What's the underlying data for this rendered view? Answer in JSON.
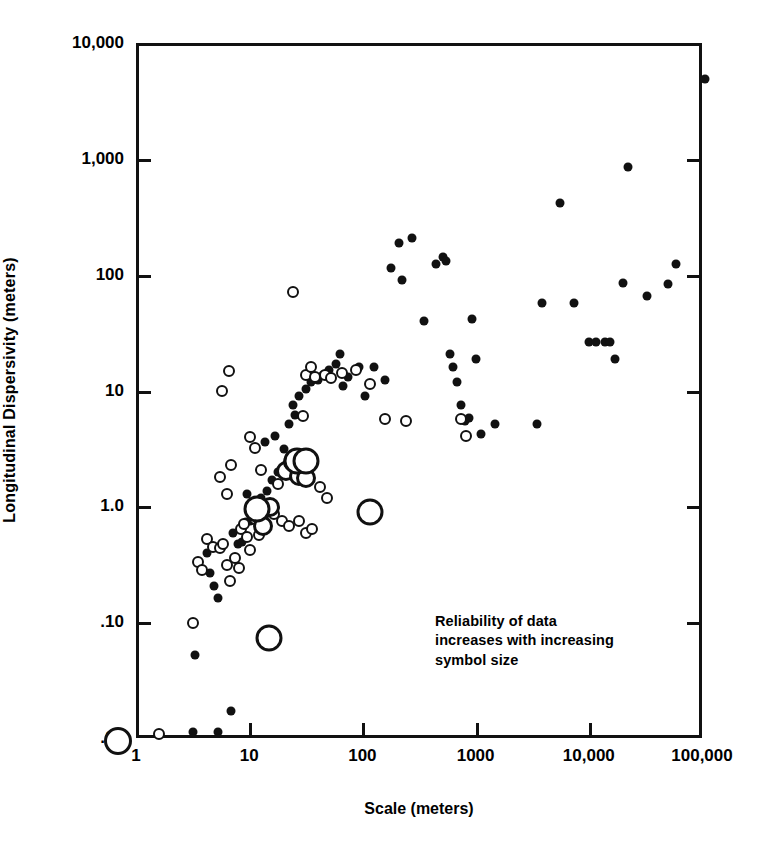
{
  "chart_data": {
    "type": "scatter",
    "title": "",
    "xlabel": "Scale (meters)",
    "ylabel": "Longitudinal Dispersivity (meters)",
    "xscale": "log",
    "yscale": "log",
    "xlim": [
      1,
      100000
    ],
    "ylim": [
      0.01,
      10000
    ],
    "xticks": [
      1,
      10,
      100,
      1000,
      10000,
      100000
    ],
    "xticklabels": [
      "1",
      "10",
      "100",
      "1000",
      "10,000",
      "100,000"
    ],
    "yticks": [
      0.01,
      0.1,
      1.0,
      10,
      100,
      1000,
      10000
    ],
    "yticklabels": [
      ".01",
      ".10",
      "1.0",
      "10",
      "100",
      "1,000",
      "10,000"
    ],
    "grid": false,
    "legend_position": "none",
    "annotation": "Reliability of data\nincreases with increasing\nsymbol size",
    "symbol_legend": {
      "description": "Symbol size encodes data reliability; larger symbol means more reliable data",
      "classes": [
        {
          "name": "low-reliability-filled",
          "style": "filled-dot",
          "px": 9
        },
        {
          "name": "moderate-reliability-open-small",
          "style": "open-circle",
          "px": 12
        },
        {
          "name": "high-reliability-open-medium",
          "style": "open-circle",
          "px": 20
        },
        {
          "name": "highest-reliability-open-large",
          "style": "open-circle",
          "px": 27
        }
      ]
    },
    "series": [
      {
        "name": "low-reliability-filled",
        "symbol": "filled-dot",
        "size_px": 9,
        "points": [
          [
            3.0,
            0.012
          ],
          [
            5.0,
            0.012
          ],
          [
            6.5,
            0.018
          ],
          [
            3.1,
            0.055
          ],
          [
            4.2,
            0.28
          ],
          [
            4.6,
            0.22
          ],
          [
            5.0,
            0.17
          ],
          [
            4.0,
            0.42
          ],
          [
            7.5,
            0.5
          ],
          [
            8.2,
            0.52
          ],
          [
            6.8,
            0.62
          ],
          [
            8.8,
            0.78
          ],
          [
            9.5,
            0.8
          ],
          [
            11.0,
            0.95
          ],
          [
            12.0,
            1.25
          ],
          [
            13.5,
            1.45
          ],
          [
            9.0,
            1.35
          ],
          [
            15.0,
            1.8
          ],
          [
            17.0,
            2.1
          ],
          [
            20.0,
            2.4
          ],
          [
            22.0,
            2.7
          ],
          [
            24.0,
            2.9
          ],
          [
            26.0,
            2.3
          ],
          [
            19.0,
            3.3
          ],
          [
            13.0,
            3.8
          ],
          [
            16.0,
            4.3
          ],
          [
            21.0,
            5.5
          ],
          [
            24.0,
            6.5
          ],
          [
            23.0,
            8.0
          ],
          [
            26.0,
            9.5
          ],
          [
            30.0,
            11.0
          ],
          [
            33.0,
            12.5
          ],
          [
            38.0,
            13.0
          ],
          [
            42.0,
            14.5
          ],
          [
            48.0,
            16.0
          ],
          [
            55.0,
            18.0
          ],
          [
            60.0,
            22.0
          ],
          [
            64.0,
            11.5
          ],
          [
            70.0,
            14.0
          ],
          [
            88.0,
            17.0
          ],
          [
            100.0,
            9.5
          ],
          [
            120.0,
            17.0
          ],
          [
            150.0,
            13.0
          ],
          [
            200.0,
            200.0
          ],
          [
            260.0,
            220.0
          ],
          [
            170.0,
            120.0
          ],
          [
            210.0,
            95.0
          ],
          [
            330.0,
            42.0
          ],
          [
            420.0,
            130.0
          ],
          [
            480.0,
            150.0
          ],
          [
            520.0,
            140.0
          ],
          [
            560.0,
            22.0
          ],
          [
            600.0,
            17.0
          ],
          [
            640.0,
            12.5
          ],
          [
            700.0,
            8.0
          ],
          [
            760.0,
            5.8
          ],
          [
            820.0,
            6.2
          ],
          [
            880.0,
            44.0
          ],
          [
            950.0,
            20.0
          ],
          [
            1050.0,
            4.5
          ],
          [
            1400.0,
            5.5
          ],
          [
            3300.0,
            5.5
          ],
          [
            3600.0,
            60.0
          ],
          [
            5200.0,
            440.0
          ],
          [
            7000.0,
            60.0
          ],
          [
            9500.0,
            28.0
          ],
          [
            11000.0,
            28.0
          ],
          [
            13000.0,
            28.0
          ],
          [
            14500.0,
            28.0
          ],
          [
            16000.0,
            20.0
          ],
          [
            19000.0,
            90.0
          ],
          [
            21000.0,
            900.0
          ],
          [
            31000.0,
            70.0
          ],
          [
            47000.0,
            88.0
          ],
          [
            56000.0,
            130.0
          ],
          [
            100000.0,
            5200.0
          ]
        ]
      },
      {
        "name": "moderate-reliability-open-small",
        "symbol": "open-circle",
        "size_px": 12,
        "points": [
          [
            1.5,
            0.0115
          ],
          [
            3.0,
            0.105
          ],
          [
            3.3,
            0.35
          ],
          [
            3.6,
            0.3
          ],
          [
            4.0,
            0.55
          ],
          [
            4.5,
            0.47
          ],
          [
            5.2,
            0.46
          ],
          [
            5.5,
            0.5
          ],
          [
            6.0,
            0.33
          ],
          [
            6.4,
            0.24
          ],
          [
            7.0,
            0.38
          ],
          [
            7.6,
            0.31
          ],
          [
            8.0,
            0.68
          ],
          [
            8.5,
            0.74
          ],
          [
            9.0,
            0.58
          ],
          [
            9.6,
            0.45
          ],
          [
            10.5,
            0.82
          ],
          [
            11.5,
            0.6
          ],
          [
            12.5,
            0.88
          ],
          [
            6.0,
            1.35
          ],
          [
            5.2,
            1.9
          ],
          [
            6.5,
            2.4
          ],
          [
            5.4,
            10.5
          ],
          [
            6.3,
            15.5
          ],
          [
            9.5,
            4.2
          ],
          [
            10.5,
            3.4
          ],
          [
            12.0,
            2.2
          ],
          [
            14.0,
            1.05
          ],
          [
            15.5,
            0.92
          ],
          [
            17.0,
            1.65
          ],
          [
            18.5,
            0.8
          ],
          [
            21.0,
            0.72
          ],
          [
            26.0,
            0.8
          ],
          [
            30.0,
            0.62
          ],
          [
            34.0,
            0.68
          ],
          [
            40.0,
            1.55
          ],
          [
            46.0,
            1.25
          ],
          [
            28.0,
            6.4
          ],
          [
            30.0,
            14.5
          ],
          [
            33.0,
            17.0
          ],
          [
            23.0,
            75.0
          ],
          [
            36.0,
            14.0
          ],
          [
            44.0,
            14.5
          ],
          [
            50.0,
            13.5
          ],
          [
            62.0,
            15.0
          ],
          [
            82.0,
            16.0
          ],
          [
            110.0,
            12.0
          ],
          [
            150.0,
            6.0
          ],
          [
            230.0,
            5.8
          ],
          [
            700.0,
            6.0
          ],
          [
            780.0,
            4.3
          ]
        ]
      },
      {
        "name": "high-reliability-open-medium",
        "symbol": "open-circle",
        "size_px": 20,
        "points": [
          [
            12.5,
            0.72
          ],
          [
            14.5,
            1.05
          ],
          [
            20.0,
            2.15
          ],
          [
            23.0,
            2.55
          ],
          [
            26.0,
            1.95
          ],
          [
            30.0,
            1.85
          ]
        ]
      },
      {
        "name": "highest-reliability-open-large",
        "symbol": "open-circle",
        "size_px": 27,
        "points": [
          [
            11.0,
            1.0
          ],
          [
            14.0,
            0.078
          ],
          [
            25.0,
            2.6
          ],
          [
            30.0,
            2.6
          ],
          [
            110.0,
            0.95
          ]
        ]
      }
    ]
  },
  "axis_title_y": "Longitudinal Dispersivity (meters)",
  "axis_title_x": "Scale (meters)",
  "annotation_text": "Reliability of data\nincreases with increasing\nsymbol size",
  "tick_labels": {
    "y": [
      "10,000",
      "1,000",
      "100",
      "10",
      "1.0",
      ".10",
      ".01"
    ],
    "x": [
      "1",
      "10",
      "100",
      "1000",
      "10,000",
      "100,000"
    ]
  },
  "colors": {
    "ink": "#111111",
    "background": "#ffffff"
  }
}
